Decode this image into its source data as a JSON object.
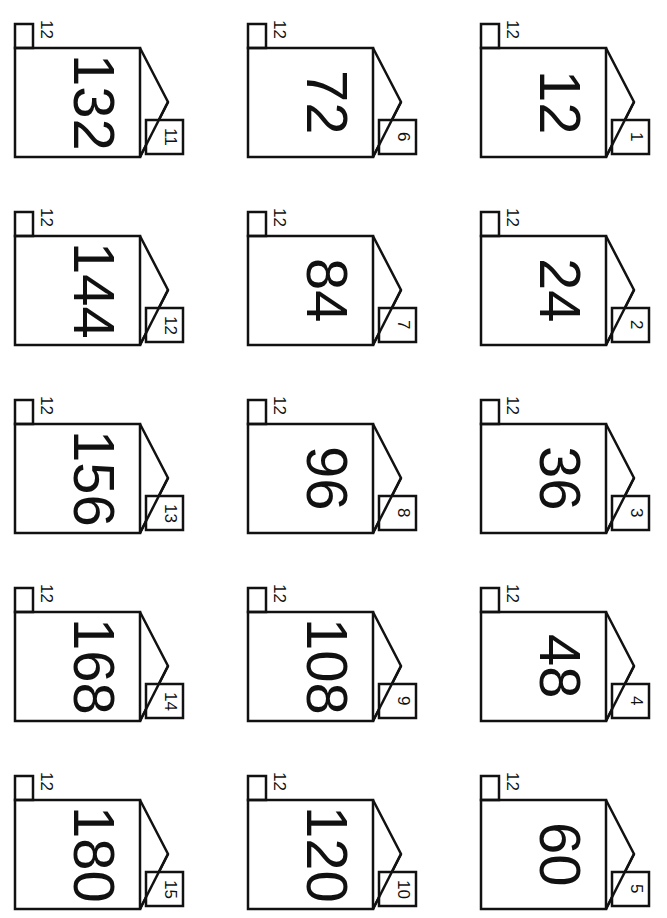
{
  "worksheet": {
    "orientation": "rotated 90deg clockwise",
    "factor": "12",
    "houses": [
      {
        "top": "12",
        "product": "132",
        "door": "11"
      },
      {
        "top": "12",
        "product": "72",
        "door": "6"
      },
      {
        "top": "12",
        "product": "12",
        "door": "1"
      },
      {
        "top": "12",
        "product": "144",
        "door": "12"
      },
      {
        "top": "12",
        "product": "84",
        "door": "7"
      },
      {
        "top": "12",
        "product": "24",
        "door": "2"
      },
      {
        "top": "12",
        "product": "156",
        "door": "13"
      },
      {
        "top": "12",
        "product": "96",
        "door": "8"
      },
      {
        "top": "12",
        "product": "36",
        "door": "3"
      },
      {
        "top": "12",
        "product": "168",
        "door": "14"
      },
      {
        "top": "12",
        "product": "108",
        "door": "9"
      },
      {
        "top": "12",
        "product": "48",
        "door": "4"
      },
      {
        "top": "12",
        "product": "180",
        "door": "15"
      },
      {
        "top": "12",
        "product": "120",
        "door": "10"
      },
      {
        "top": "12",
        "product": "60",
        "door": "5"
      }
    ]
  },
  "colors": {
    "line": "#111111",
    "background": "#ffffff"
  }
}
